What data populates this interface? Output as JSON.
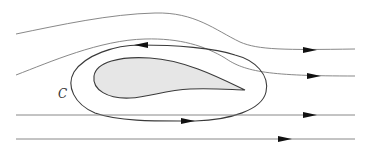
{
  "diagram": {
    "contour_label": "C",
    "colors": {
      "streamline": "#7a7a7a",
      "contour": "#3a3a3a",
      "airfoil_fill": "#e6e6e6",
      "arrowhead": "#111111"
    },
    "elements": {
      "streamlines": [
        {
          "id": "streamline-1",
          "direction": "right",
          "shape": "curved-over-airfoil"
        },
        {
          "id": "streamline-2",
          "direction": "right",
          "shape": "curved-near-airfoil"
        },
        {
          "id": "streamline-3",
          "direction": "right",
          "shape": "straight"
        },
        {
          "id": "streamline-4",
          "direction": "right",
          "shape": "straight"
        }
      ],
      "contour": {
        "id": "contour-c",
        "direction": "counterclockwise",
        "arrows": [
          "top-left-pointing",
          "bottom-right-pointing"
        ]
      },
      "body": {
        "id": "airfoil",
        "fill": "gray"
      }
    }
  }
}
